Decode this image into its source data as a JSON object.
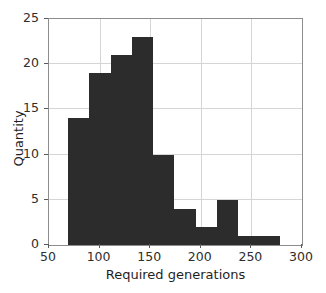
{
  "chart_data": {
    "type": "bar",
    "chart_subtype": "histogram",
    "title": "",
    "xlabel": "Required generations",
    "ylabel": "Quantity",
    "xlim": [
      50,
      300
    ],
    "ylim": [
      0,
      25
    ],
    "xticks": [
      50,
      100,
      150,
      200,
      250,
      300
    ],
    "yticks": [
      0,
      5,
      10,
      15,
      20,
      25
    ],
    "xtick_labels": [
      "50",
      "100",
      "150",
      "200",
      "250",
      "300"
    ],
    "ytick_labels": [
      "0",
      "5",
      "10",
      "15",
      "20",
      "25"
    ],
    "grid": true,
    "legend": null,
    "bar_color": "#2c2c2c",
    "grid_color": "#d5d5d5",
    "frame_color": "#8d8d8d",
    "bin_edges": [
      69,
      90,
      111,
      132,
      153,
      174,
      195,
      216,
      237,
      257,
      278
    ],
    "categories": [
      "69-90",
      "90-111",
      "111-132",
      "132-153",
      "153-174",
      "174-195",
      "195-216",
      "216-237",
      "237-257",
      "257-278"
    ],
    "values": [
      14,
      19,
      21,
      23,
      10,
      4,
      2,
      5,
      1,
      1
    ],
    "bars": [
      {
        "bin_start": 69,
        "bin_end": 90,
        "value": 14
      },
      {
        "bin_start": 90,
        "bin_end": 111,
        "value": 19
      },
      {
        "bin_start": 111,
        "bin_end": 132,
        "value": 21
      },
      {
        "bin_start": 132,
        "bin_end": 153,
        "value": 23
      },
      {
        "bin_start": 153,
        "bin_end": 174,
        "value": 10
      },
      {
        "bin_start": 174,
        "bin_end": 195,
        "value": 4
      },
      {
        "bin_start": 195,
        "bin_end": 216,
        "value": 2
      },
      {
        "bin_start": 216,
        "bin_end": 237,
        "value": 5
      },
      {
        "bin_start": 237,
        "bin_end": 257,
        "value": 1
      },
      {
        "bin_start": 257,
        "bin_end": 278,
        "value": 1
      }
    ]
  }
}
